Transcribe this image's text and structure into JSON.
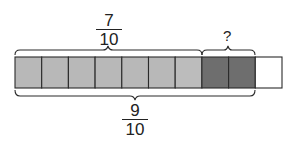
{
  "diagram": {
    "type": "fraction-bar-model",
    "total_cells": 10,
    "cells": [
      {
        "index": 1,
        "state": "light",
        "color": "#b8b8b8"
      },
      {
        "index": 2,
        "state": "light",
        "color": "#b8b8b8"
      },
      {
        "index": 3,
        "state": "light",
        "color": "#b8b8b8"
      },
      {
        "index": 4,
        "state": "light",
        "color": "#b8b8b8"
      },
      {
        "index": 5,
        "state": "light",
        "color": "#b8b8b8"
      },
      {
        "index": 6,
        "state": "light",
        "color": "#b8b8b8"
      },
      {
        "index": 7,
        "state": "light",
        "color": "#bcbcbc"
      },
      {
        "index": 8,
        "state": "dark",
        "color": "#6e6e6e"
      },
      {
        "index": 9,
        "state": "dark",
        "color": "#6e6e6e"
      },
      {
        "index": 10,
        "state": "empty",
        "color": "#ffffff"
      }
    ],
    "top_label_left": {
      "numerator": "7",
      "denominator": "10",
      "spans_cells": [
        1,
        7
      ]
    },
    "top_label_right": {
      "text": "?",
      "spans_cells": [
        8,
        9
      ]
    },
    "bottom_label": {
      "numerator": "9",
      "denominator": "10",
      "spans_cells": [
        1,
        9
      ]
    },
    "colors": {
      "stroke": "#2a2a2a",
      "light_fill": "#b8b8b8",
      "dark_fill": "#6e6e6e",
      "empty_fill": "#ffffff"
    }
  }
}
